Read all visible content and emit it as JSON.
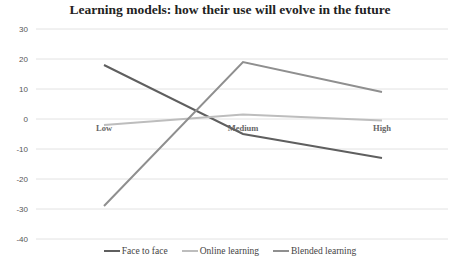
{
  "chart_data": {
    "type": "line",
    "title": "Learning models: how their use will evolve in the future",
    "xlabel": "",
    "ylabel": "",
    "categories": [
      "Low",
      "Medium",
      "High"
    ],
    "series": [
      {
        "name": "Face to face",
        "values": [
          18,
          -5,
          -13
        ],
        "color": "#5f5f5f"
      },
      {
        "name": "Online learning",
        "values": [
          -2,
          1.5,
          -0.5
        ],
        "color": "#bdbdbd"
      },
      {
        "name": "Blended learning",
        "values": [
          -29,
          19,
          9
        ],
        "color": "#8f8f8f"
      }
    ],
    "yticks": [
      30,
      20,
      10,
      0,
      -10,
      -20,
      -30,
      -40
    ],
    "ylim": [
      -40,
      30
    ],
    "grid": true,
    "legend_position": "bottom"
  }
}
